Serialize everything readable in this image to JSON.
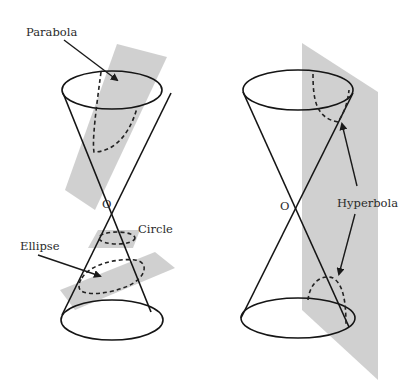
{
  "diagram": {
    "left_figure": {
      "labels": {
        "parabola": "Parabola",
        "vertex": "O",
        "circle": "Circle",
        "ellipse": "Ellipse"
      }
    },
    "right_figure": {
      "labels": {
        "vertex": "O",
        "hyperbola": "Hyperbola"
      }
    },
    "colors": {
      "plane": "#c8c8c8",
      "line": "#151515",
      "background": "#ffffff"
    }
  }
}
